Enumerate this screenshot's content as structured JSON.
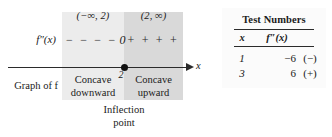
{
  "diagram": {
    "function_label": "f″(x)",
    "axis_label": "x",
    "tick_value": "2",
    "graph_of_label": "Graph of f",
    "intervals": [
      {
        "label": "(−∞, 2)",
        "concavity_line1": "Concave",
        "concavity_line2": "downward"
      },
      {
        "label": "(2, ∞)",
        "concavity_line1": "Concave",
        "concavity_line2": "upward"
      }
    ],
    "sign_row": {
      "negative_signs": "− − − −",
      "zero": "0",
      "positive_signs": "+ + + +"
    },
    "inflection_caption_line1": "Inflection",
    "inflection_caption_line2": "point",
    "colors": {
      "band_left": "#ececec",
      "band_right": "#d9d9d9",
      "axis": "#2b2b2b",
      "dot": "#111111"
    }
  },
  "table": {
    "title": "Test Numbers",
    "columns": [
      "x",
      "f″(x)"
    ],
    "rows": [
      {
        "x": "1",
        "value": "−6",
        "sign": "(−)"
      },
      {
        "x": "3",
        "value": "6",
        "sign": "(+)"
      }
    ],
    "background": "#fbfbfb"
  }
}
